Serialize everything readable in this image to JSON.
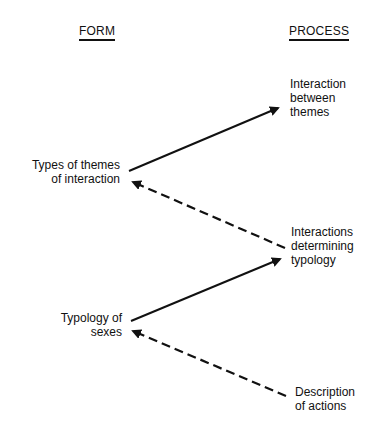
{
  "headers": {
    "form": "FORM",
    "process": "PROCESS"
  },
  "nodes": {
    "form": [
      {
        "id": "types_of_themes",
        "text": "Types of themes\nof interaction"
      },
      {
        "id": "typology_of_sexes",
        "text": "Typology of\nsexes"
      }
    ],
    "process": [
      {
        "id": "interaction_between_themes",
        "text": "Interaction\nbetween\nthemes"
      },
      {
        "id": "interactions_determining_typology",
        "text": "Interactions\ndetermining\ntypology"
      },
      {
        "id": "description_of_actions",
        "text": "Description\nof actions"
      }
    ]
  },
  "edges": [
    {
      "from": "types_of_themes",
      "to": "interaction_between_themes",
      "style": "solid"
    },
    {
      "from": "interactions_determining_typology",
      "to": "types_of_themes",
      "style": "dashed"
    },
    {
      "from": "typology_of_sexes",
      "to": "interactions_determining_typology",
      "style": "solid"
    },
    {
      "from": "description_of_actions",
      "to": "typology_of_sexes",
      "style": "dashed"
    }
  ]
}
